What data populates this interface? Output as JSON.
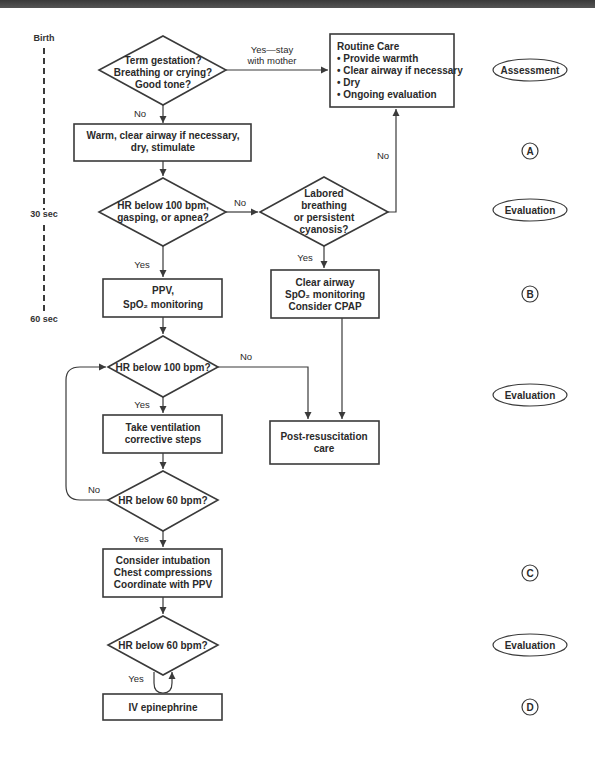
{
  "timeline": {
    "labels": [
      "Birth",
      "30 sec",
      "60 sec"
    ]
  },
  "nodes": {
    "d1": [
      "Term gestation?",
      "Breathing or crying?",
      "Good tone?"
    ],
    "routine": {
      "title": "Routine Care",
      "items": [
        "• Provide warmth",
        "• Clear airway if necessary",
        "• Dry",
        "• Ongoing evaluation"
      ]
    },
    "warm": [
      "Warm, clear airway if necessary,",
      "dry, stimulate"
    ],
    "d2": [
      "HR below 100 bpm,",
      "gasping, or apnea?"
    ],
    "d3": [
      "Labored",
      "breathing",
      "or persistent",
      "cyanosis?"
    ],
    "ppv": [
      "PPV,",
      "SpO₂ monitoring"
    ],
    "clear": [
      "Clear airway",
      "SpO₂ monitoring",
      "Consider CPAP"
    ],
    "d4": "HR below 100 bpm?",
    "ventilation": [
      "Take ventilation",
      "corrective steps"
    ],
    "post": [
      "Post-resuscitation",
      "care"
    ],
    "d5": "HR below 60 bpm?",
    "intubation": [
      "Consider intubation",
      "Chest compressions",
      "Coordinate with PPV"
    ],
    "d6": "HR below 60 bpm?",
    "epi": "IV epinephrine"
  },
  "edge_labels": {
    "yes_stay": [
      "Yes—stay",
      "with mother"
    ],
    "no": "No",
    "yes": "Yes"
  },
  "stages": {
    "assessment": "Assessment",
    "evaluation": "Evaluation",
    "a": "A",
    "b": "B",
    "c": "C",
    "d": "D"
  }
}
